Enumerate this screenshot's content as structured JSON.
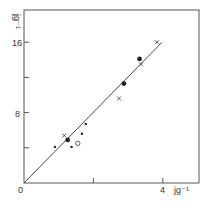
{
  "chart_data": {
    "type": "scatter",
    "title": "",
    "xlabel": "J g-1",
    "ylabel": "J g-1",
    "xlim": [
      0,
      5.1
    ],
    "ylim": [
      0,
      19.7
    ],
    "x_ticks": [
      0,
      2,
      4
    ],
    "x_tick_labels": [
      "0",
      "",
      "4"
    ],
    "y_ticks": [
      0,
      4,
      8,
      12,
      16
    ],
    "y_tick_labels": [
      "",
      "",
      "8",
      "",
      "16"
    ],
    "grid": false,
    "legend": null,
    "series": [
      {
        "name": "crosses",
        "marker": "x",
        "points": [
          [
            3.83,
            16.0
          ],
          [
            3.37,
            13.5
          ],
          [
            2.74,
            9.6
          ],
          [
            1.16,
            5.4
          ]
        ]
      },
      {
        "name": "filled circles",
        "marker": "filled-circle",
        "points": [
          [
            3.33,
            14.1
          ],
          [
            2.88,
            11.3
          ],
          [
            1.26,
            4.9
          ]
        ]
      },
      {
        "name": "small dots",
        "marker": "dot",
        "points": [
          [
            1.78,
            6.7
          ],
          [
            1.67,
            5.6
          ],
          [
            1.37,
            4.1
          ],
          [
            0.89,
            4.1
          ]
        ]
      },
      {
        "name": "open circles",
        "marker": "open-circle",
        "points": [
          [
            1.55,
            4.5
          ]
        ]
      }
    ],
    "fit_line": {
      "x": [
        0,
        3.98
      ],
      "y": [
        0,
        16.0
      ],
      "slope": 4.0
    }
  },
  "labels": {
    "origin": "0",
    "x_tick_4": "4",
    "x_unit": "jg⁻¹",
    "y_tick_8": "8",
    "y_tick_16": "16",
    "y_unit": "jg⁻¹"
  }
}
